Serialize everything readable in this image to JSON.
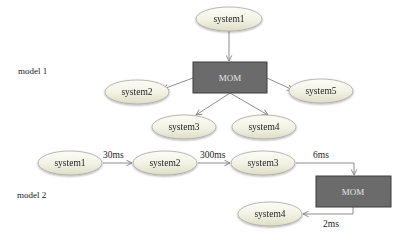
{
  "model1": {
    "label": "model 1",
    "hub": {
      "label": "MOM",
      "x": 193,
      "y": 62,
      "w": 74,
      "h": 31
    },
    "nodes": [
      {
        "id": "system1",
        "label": "system1",
        "cx": 229,
        "cy": 19
      },
      {
        "id": "system2",
        "label": "system2",
        "cx": 137,
        "cy": 92
      },
      {
        "id": "system5",
        "label": "system5",
        "cx": 321,
        "cy": 91
      },
      {
        "id": "system3",
        "label": "system3",
        "cx": 184,
        "cy": 127
      },
      {
        "id": "system4",
        "label": "system4",
        "cx": 264,
        "cy": 127
      }
    ]
  },
  "model2": {
    "label": "model 2",
    "hub": {
      "label": "MOM",
      "x": 316,
      "y": 176,
      "w": 75,
      "h": 31
    },
    "nodes": [
      {
        "id": "system1",
        "label": "system1",
        "cx": 70,
        "cy": 163
      },
      {
        "id": "system2",
        "label": "system2",
        "cx": 165,
        "cy": 163
      },
      {
        "id": "system3",
        "label": "system3",
        "cx": 263,
        "cy": 163
      },
      {
        "id": "system4",
        "label": "system4",
        "cx": 270,
        "cy": 214
      }
    ],
    "edges": [
      {
        "from": "system1",
        "to": "system2",
        "label": "30ms"
      },
      {
        "from": "system2",
        "to": "system3",
        "label": "300ms"
      },
      {
        "from": "system3",
        "to": "MOM",
        "label": "6ms"
      },
      {
        "from": "MOM",
        "to": "system4",
        "label": "2ms"
      }
    ]
  },
  "colors": {
    "ellipse_fill_top": "#fbfbf2",
    "ellipse_fill_bottom": "#e8e8d4",
    "ellipse_stroke": "#a8a8a8",
    "hub_fill": "#6b6b6b",
    "hub_stroke": "#3d3d3d",
    "edge": "#808080"
  }
}
